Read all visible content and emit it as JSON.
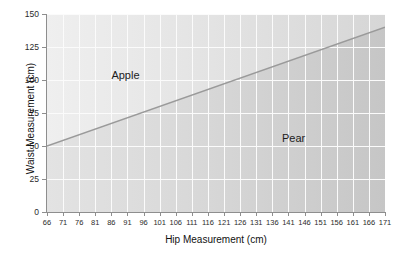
{
  "chart_data": {
    "type": "line",
    "title": "",
    "xlabel": "Hip Measurement (cm)",
    "ylabel": "Waist Measurement (cm)",
    "xlim": [
      66,
      171
    ],
    "ylim": [
      0,
      150
    ],
    "grid": true,
    "legend_position": "none",
    "x_ticks": [
      66,
      71,
      76,
      81,
      86,
      91,
      96,
      101,
      106,
      111,
      116,
      121,
      126,
      131,
      136,
      141,
      146,
      151,
      156,
      161,
      166,
      171
    ],
    "y_ticks": [
      0,
      25,
      50,
      75,
      100,
      125,
      150
    ],
    "series": [
      {
        "name": "Apple/Pear boundary",
        "x": [
          66,
          171
        ],
        "values": [
          50,
          140
        ],
        "color": "#9a9a9a"
      }
    ],
    "annotations": [
      {
        "text": "Apple",
        "x": 86,
        "y": 103
      },
      {
        "text": "Pear",
        "x": 139,
        "y": 55
      }
    ],
    "regions": [
      {
        "name": "Apple",
        "label": "Apple",
        "position": "above-line",
        "fill": "#e8e8e8"
      },
      {
        "name": "Pear",
        "label": "Pear",
        "position": "below-line",
        "fill": "#d4d4d4"
      }
    ]
  },
  "axes": {
    "x_title": "Hip Measurement (cm)",
    "y_title": "Waist Measurement (cm)"
  },
  "labels": {
    "apple": "Apple",
    "pear": "Pear"
  },
  "colors": {
    "line": "#9a9a9a",
    "grid": "#fbfbfb",
    "axis": "#8e8e8e",
    "text": "#1a1a1a",
    "plot_background_left": "#efefef",
    "plot_background_right": "#d6d6d6"
  }
}
